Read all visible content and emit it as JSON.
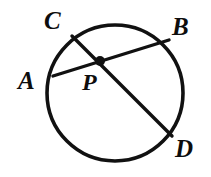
{
  "figure": {
    "name": "circle-with-two-chords",
    "background_color": "#ffffff",
    "stroke_color": "#111111",
    "labels": {
      "A": "A",
      "B": "B",
      "C": "C",
      "D": "D",
      "P": "P"
    }
  },
  "chart_data": {
    "type": "diagram",
    "subtype": "euclidean-geometry",
    "title": "",
    "xlabel": "",
    "ylabel": "",
    "grid": false,
    "legend": null,
    "canvas": {
      "width": 211,
      "height": 177
    },
    "circle": {
      "label": "circle P",
      "center": {
        "x": 115,
        "y": 93
      },
      "radius": 68,
      "stroke": "#111111",
      "stroke_width": 3.6,
      "fill": "none"
    },
    "points": [
      {
        "name": "A",
        "x": 53,
        "y": 76,
        "on": "circle",
        "marked": false
      },
      {
        "name": "B",
        "x": 169,
        "y": 40,
        "on": "circle",
        "marked": false
      },
      {
        "name": "C",
        "x": 72,
        "y": 36,
        "on": "circle",
        "marked": false
      },
      {
        "name": "D",
        "x": 172,
        "y": 136,
        "on": "circle",
        "marked": false
      },
      {
        "name": "P",
        "x": 100,
        "y": 61,
        "on": "interior",
        "marked": true,
        "dot_radius": 5
      }
    ],
    "segments": [
      {
        "name": "chord-AB",
        "from": "A",
        "to": "B",
        "through": "P",
        "stroke": "#111111",
        "stroke_width": 3.4
      },
      {
        "name": "chord-CD",
        "from": "C",
        "to": "D",
        "through": "P",
        "stroke": "#111111",
        "stroke_width": 3.4
      }
    ],
    "label_positions": [
      {
        "name": "A",
        "x": 18,
        "y": 68
      },
      {
        "name": "B",
        "x": 172,
        "y": 14
      },
      {
        "name": "C",
        "x": 44,
        "y": 8
      },
      {
        "name": "D",
        "x": 175,
        "y": 136
      },
      {
        "name": "P",
        "x": 82,
        "y": 70
      }
    ]
  }
}
